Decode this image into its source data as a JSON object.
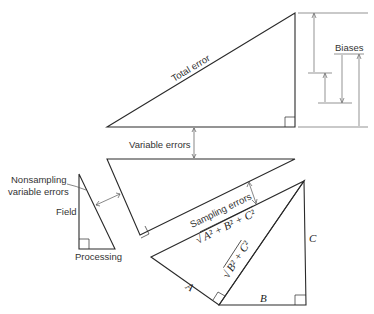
{
  "diagram": {
    "labels": {
      "total_error": "Total error",
      "biases": "Biases",
      "variable_errors": "Variable errors",
      "nonsampling_line1": "Nonsampling",
      "nonsampling_line2": "variable errors",
      "field": "Field",
      "processing": "Processing",
      "sampling_errors": "Sampling errors",
      "hyp_abc_root": "√",
      "hyp_abc": "A² + B² + C²",
      "hyp_bc": "B² + C²",
      "side_a": "A",
      "side_b": "B",
      "side_c": "C"
    },
    "colors": {
      "line": "#2a2a2a",
      "thin_line": "#555555",
      "text": "#333333"
    }
  }
}
